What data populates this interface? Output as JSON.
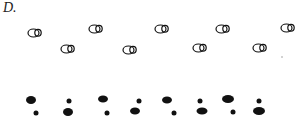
{
  "label": "D.",
  "colors": {
    "ink": "#111111",
    "background": "#ffffff"
  },
  "outline_footprints": [
    {
      "x": 35,
      "y": 33
    },
    {
      "x": 96,
      "y": 29
    },
    {
      "x": 162,
      "y": 29
    },
    {
      "x": 223,
      "y": 29
    },
    {
      "x": 288,
      "y": 28
    },
    {
      "x": 68,
      "y": 49
    },
    {
      "x": 130,
      "y": 50
    },
    {
      "x": 200,
      "y": 48
    },
    {
      "x": 260,
      "y": 48
    }
  ],
  "stray_dot": {
    "x": 282,
    "y": 57
  },
  "solid_large": [
    {
      "x": 31,
      "y": 100,
      "rx": 5,
      "ry": 4
    },
    {
      "x": 103,
      "y": 99,
      "rx": 5,
      "ry": 3.5
    },
    {
      "x": 167,
      "y": 100,
      "rx": 5,
      "ry": 3.5
    },
    {
      "x": 228,
      "y": 99,
      "rx": 6,
      "ry": 4
    },
    {
      "x": 68,
      "y": 112,
      "rx": 5,
      "ry": 4
    },
    {
      "x": 135,
      "y": 111,
      "rx": 5,
      "ry": 3.5
    },
    {
      "x": 202,
      "y": 111,
      "rx": 5.5,
      "ry": 3.5
    },
    {
      "x": 259,
      "y": 111,
      "rx": 6,
      "ry": 4
    }
  ],
  "solid_small": [
    {
      "x": 69,
      "y": 101,
      "r": 2.5
    },
    {
      "x": 139,
      "y": 101,
      "r": 2.5
    },
    {
      "x": 200,
      "y": 101,
      "r": 2.5
    },
    {
      "x": 259,
      "y": 101,
      "r": 2.5
    },
    {
      "x": 36,
      "y": 113,
      "r": 2.5
    },
    {
      "x": 107,
      "y": 113,
      "r": 2.5
    },
    {
      "x": 174,
      "y": 113,
      "r": 2.5
    },
    {
      "x": 233,
      "y": 112,
      "r": 2.5
    }
  ]
}
